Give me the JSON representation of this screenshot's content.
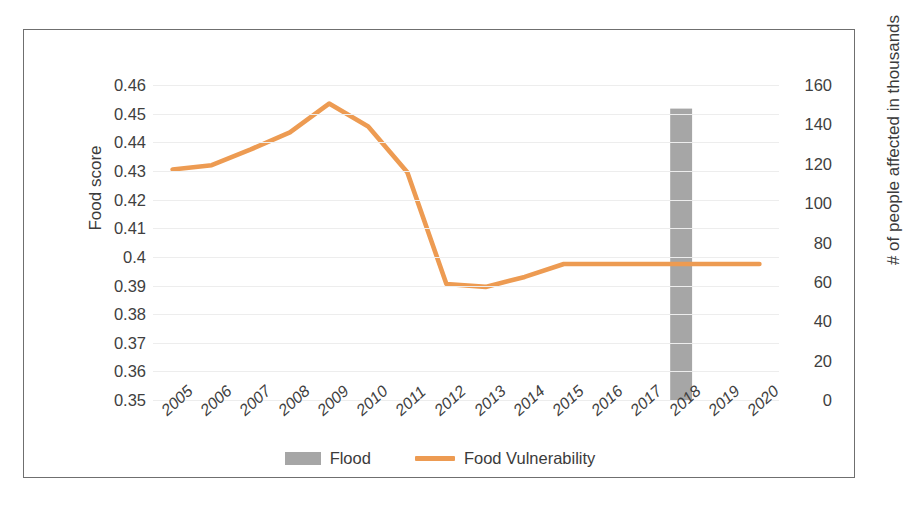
{
  "chart_data": {
    "type": "line",
    "title": "",
    "subtitle": "",
    "xlabel": "",
    "categories": [
      "2005",
      "2006",
      "2007",
      "2008",
      "2009",
      "2010",
      "2011",
      "2012",
      "2013",
      "2014",
      "2015",
      "2016",
      "2017",
      "2018",
      "2019",
      "2020"
    ],
    "grid": true,
    "legend_position": "bottom",
    "axes": {
      "left": {
        "label": "Food score",
        "ticks": [
          "0.46",
          "0.45",
          "0.44",
          "0.43",
          "0.42",
          "0.41",
          "0.4",
          "0.39",
          "0.38",
          "0.37",
          "0.36",
          "0.35"
        ],
        "tick_values": [
          0.46,
          0.45,
          0.44,
          0.43,
          0.42,
          0.41,
          0.4,
          0.39,
          0.38,
          0.37,
          0.36,
          0.35
        ],
        "min": 0.35,
        "max": 0.46,
        "step": 0.01
      },
      "right": {
        "label": "# of people affected in thousands",
        "ticks": [
          "160",
          "140",
          "120",
          "100",
          "80",
          "60",
          "40",
          "20",
          "0"
        ],
        "tick_values": [
          160,
          140,
          120,
          100,
          80,
          60,
          40,
          20,
          0
        ],
        "min": 0,
        "max": 160,
        "step": 20
      }
    },
    "series": [
      {
        "name": "Flood",
        "type": "bar",
        "axis": "right",
        "color": "#a6a6a6",
        "values": [
          0,
          0,
          0,
          0,
          0,
          0,
          0,
          0,
          0,
          0,
          0,
          0,
          0,
          148,
          0,
          0
        ]
      },
      {
        "name": "Food Vulnerability",
        "type": "line",
        "axis": "left",
        "color": "#ed9b52",
        "values": [
          0.4305,
          0.432,
          0.4375,
          0.4435,
          0.4535,
          0.4455,
          0.4295,
          0.3905,
          0.3895,
          0.393,
          0.3975,
          0.3975,
          0.3975,
          0.3975,
          0.3975,
          0.3975
        ]
      }
    ]
  },
  "legend": {
    "items": [
      {
        "label": "Flood",
        "marker": "bar-swatch",
        "color": "#a6a6a6"
      },
      {
        "label": "Food Vulnerability",
        "marker": "line-swatch",
        "color": "#ed9b52"
      }
    ]
  }
}
